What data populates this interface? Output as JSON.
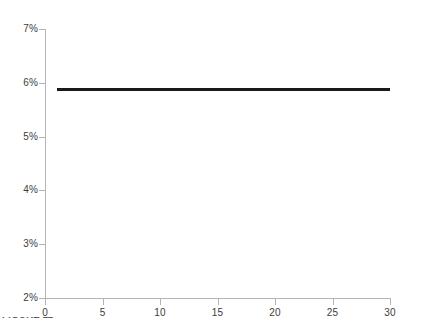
{
  "chart_data": {
    "type": "line",
    "title": "",
    "subtitle": "",
    "xlabel": "",
    "ylabel": "",
    "xlim": [
      0,
      30
    ],
    "ylim": [
      2,
      7
    ],
    "grid": false,
    "legend": null,
    "x_ticks": [
      0,
      5,
      10,
      15,
      20,
      25,
      30
    ],
    "x_tick_labels": [
      "0",
      "5",
      "10",
      "15",
      "20",
      "25",
      "30"
    ],
    "y_ticks": [
      2,
      3,
      4,
      5,
      6,
      7
    ],
    "y_tick_labels": [
      "2%",
      "3%",
      "4%",
      "5%",
      "6%",
      "7%"
    ],
    "series": [
      {
        "name": "",
        "color": "#1a1a1a",
        "line_width": 3,
        "x": [
          1,
          30
        ],
        "y": [
          5.87,
          5.87
        ],
        "constant_value": 5.87
      }
    ],
    "annotations": [],
    "colors": {
      "axis": "#b4b4b4",
      "tick_label": "#3c3c3c",
      "series": "#1a1a1a",
      "background": "#ffffff"
    }
  },
  "caption": {
    "fragment_text": "FIGURE 11"
  }
}
